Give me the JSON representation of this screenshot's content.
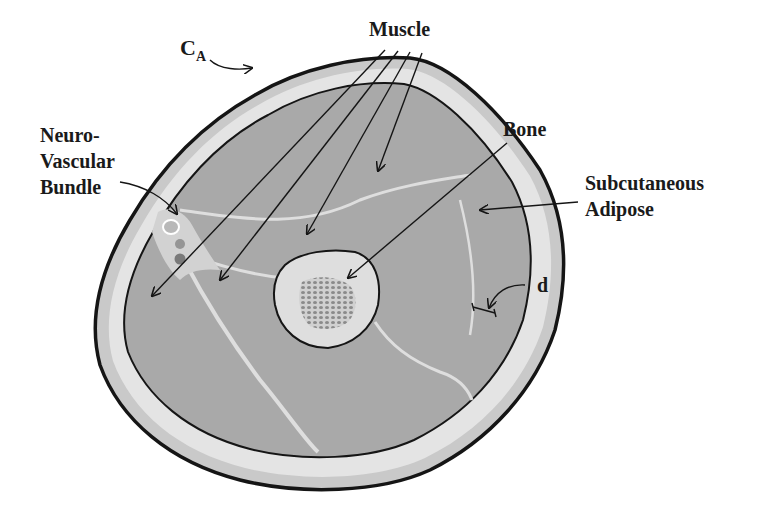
{
  "diagram": {
    "labels": {
      "circumference": {
        "main": "C",
        "sub": "A"
      },
      "muscle": "Muscle",
      "neurovascular": [
        "Neuro-",
        "Vascular",
        "Bundle"
      ],
      "bone": "Bone",
      "subcutaneous": [
        "Subcutaneous",
        "Adipose"
      ],
      "thickness": "d"
    },
    "colors": {
      "background": "#ffffff",
      "outline": "#151515",
      "skin": "#c9c9c9",
      "adipose": "#e4e4e4",
      "muscle": "#a9a9a9",
      "septa": "#dedede",
      "bone_cortex": "#dedede",
      "marrow": "#b5b5b5",
      "vessel_dark": "#7a7a7a",
      "vessel_mid": "#959595"
    }
  }
}
